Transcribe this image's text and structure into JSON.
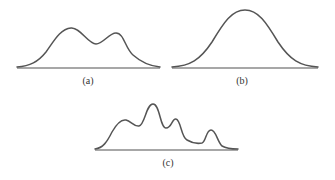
{
  "figures": [
    {
      "id": "a",
      "label": "(a)",
      "description": "bimodal distribution curve with two peaks, left peak taller",
      "peaks": 2
    },
    {
      "id": "b",
      "label": "(b)",
      "description": "unimodal bell-shaped (normal) distribution curve",
      "peaks": 1
    },
    {
      "id": "c",
      "label": "(c)",
      "description": "multimodal distribution curve with four peaks, second peak tallest",
      "peaks": 4
    }
  ],
  "colors": {
    "curve": "#555555",
    "axis": "#8a8a8a",
    "label": "#333333"
  }
}
